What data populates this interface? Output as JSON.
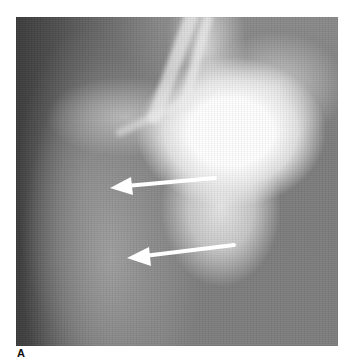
{
  "figure": {
    "label": "A",
    "arrows": [
      {
        "name": "upper-arrow",
        "tip": [
          111,
          188
        ],
        "tail": [
          215,
          178
        ],
        "color": "#ffffff"
      },
      {
        "name": "lower-arrow",
        "tip": [
          128,
          258
        ],
        "tail": [
          234,
          245
        ],
        "color": "#ffffff"
      }
    ]
  }
}
